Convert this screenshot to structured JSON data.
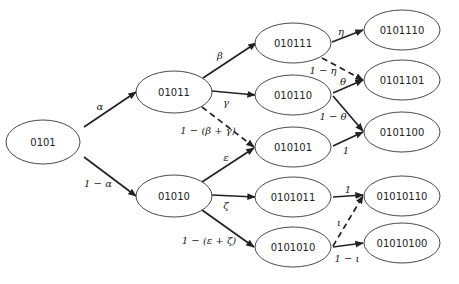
{
  "diagram": {
    "type": "probability-tree",
    "nodes": [
      {
        "id": "n0101",
        "label": "0101",
        "cx": 43,
        "cy": 142,
        "rx": 37,
        "ry": 22
      },
      {
        "id": "n01011",
        "label": "01011",
        "cx": 174,
        "cy": 92,
        "rx": 38,
        "ry": 21
      },
      {
        "id": "n01010",
        "label": "01010",
        "cx": 174,
        "cy": 196,
        "rx": 38,
        "ry": 21
      },
      {
        "id": "n010111",
        "label": "010111",
        "cx": 293,
        "cy": 43,
        "rx": 38,
        "ry": 20
      },
      {
        "id": "n010110",
        "label": "010110",
        "cx": 293,
        "cy": 95,
        "rx": 38,
        "ry": 20
      },
      {
        "id": "n010101",
        "label": "010101",
        "cx": 293,
        "cy": 147,
        "rx": 38,
        "ry": 20
      },
      {
        "id": "n0101011",
        "label": "0101011",
        "cx": 293,
        "cy": 197,
        "rx": 38,
        "ry": 20
      },
      {
        "id": "n0101010",
        "label": "0101010",
        "cx": 293,
        "cy": 247,
        "rx": 38,
        "ry": 20
      },
      {
        "id": "n0101110",
        "label": "0101110",
        "cx": 402,
        "cy": 30,
        "rx": 38,
        "ry": 20
      },
      {
        "id": "n0101101",
        "label": "0101101",
        "cx": 402,
        "cy": 80,
        "rx": 38,
        "ry": 20
      },
      {
        "id": "n0101100",
        "label": "0101100",
        "cx": 402,
        "cy": 132,
        "rx": 38,
        "ry": 20
      },
      {
        "id": "n01010110",
        "label": "01010110",
        "cx": 402,
        "cy": 196,
        "rx": 38,
        "ry": 20
      },
      {
        "id": "n01010100",
        "label": "01010100",
        "cx": 402,
        "cy": 243,
        "rx": 38,
        "ry": 20
      }
    ],
    "edges": [
      {
        "from": "0101",
        "to": "01011",
        "label": "α",
        "style": "solid",
        "x1": 84,
        "y1": 127,
        "x2": 136,
        "y2": 92,
        "lx": 100,
        "ly": 106
      },
      {
        "from": "0101",
        "to": "01010",
        "label": "1 − α",
        "style": "solid",
        "x1": 84,
        "y1": 157,
        "x2": 136,
        "y2": 196,
        "lx": 98,
        "ly": 183
      },
      {
        "from": "01011",
        "to": "010111",
        "label": "β",
        "style": "solid",
        "x1": 203,
        "y1": 78,
        "x2": 256,
        "y2": 43,
        "lx": 220,
        "ly": 55
      },
      {
        "from": "01011",
        "to": "010110",
        "label": "γ",
        "style": "solid",
        "x1": 212,
        "y1": 91,
        "x2": 255,
        "y2": 95,
        "lx": 226,
        "ly": 102
      },
      {
        "from": "01011",
        "to": "010101",
        "label": "1 − (β + γ)",
        "style": "dashed",
        "x1": 202,
        "y1": 107,
        "x2": 254,
        "y2": 147,
        "lx": 208,
        "ly": 130
      },
      {
        "from": "01010",
        "to": "010101",
        "label": "ε",
        "style": "solid",
        "x1": 202,
        "y1": 182,
        "x2": 254,
        "y2": 148,
        "lx": 226,
        "ly": 157
      },
      {
        "from": "01010",
        "to": "0101011",
        "label": "ζ",
        "style": "solid",
        "x1": 212,
        "y1": 195,
        "x2": 255,
        "y2": 197,
        "lx": 226,
        "ly": 205
      },
      {
        "from": "01010",
        "to": "0101010",
        "label": "1 − (ε + ζ)",
        "style": "solid",
        "x1": 202,
        "y1": 210,
        "x2": 254,
        "y2": 247,
        "lx": 209,
        "ly": 240
      },
      {
        "from": "010111",
        "to": "0101110",
        "label": "η",
        "style": "solid",
        "x1": 332,
        "y1": 42,
        "x2": 363,
        "y2": 30,
        "lx": 341,
        "ly": 31
      },
      {
        "from": "010111",
        "to": "0101101",
        "label": "1 − η",
        "style": "dashed",
        "x1": 322,
        "y1": 58,
        "x2": 363,
        "y2": 80,
        "lx": 323,
        "ly": 70
      },
      {
        "from": "010110",
        "to": "0101101",
        "label": "θ",
        "style": "solid",
        "x1": 333,
        "y1": 93,
        "x2": 363,
        "y2": 80,
        "lx": 343,
        "ly": 81
      },
      {
        "from": "010110",
        "to": "0101100",
        "label": "1 − θ",
        "style": "solid",
        "x1": 333,
        "y1": 96,
        "x2": 363,
        "y2": 131,
        "lx": 333,
        "ly": 116
      },
      {
        "from": "010101",
        "to": "0101100",
        "label": "1",
        "style": "solid",
        "x1": 333,
        "y1": 146,
        "x2": 363,
        "y2": 132,
        "lx": 346,
        "ly": 150
      },
      {
        "from": "0101011",
        "to": "01010110",
        "label": "1",
        "style": "solid",
        "x1": 333,
        "y1": 197,
        "x2": 363,
        "y2": 195,
        "lx": 348,
        "ly": 189
      },
      {
        "from": "0101010",
        "to": "01010110",
        "label": "ι",
        "style": "dashed",
        "x1": 333,
        "y1": 246,
        "x2": 363,
        "y2": 196,
        "lx": 339,
        "ly": 222
      },
      {
        "from": "0101010",
        "to": "01010100",
        "label": "1 − ι",
        "style": "solid",
        "x1": 333,
        "y1": 247,
        "x2": 363,
        "y2": 243,
        "lx": 347,
        "ly": 258
      }
    ]
  }
}
